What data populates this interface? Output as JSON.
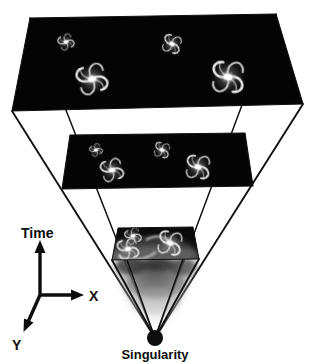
{
  "figure": {
    "type": "diagram",
    "background_color": "#ffffff",
    "line_color": "#111111",
    "slice_color": "#050505",
    "labels": {
      "time_axis": "Time",
      "x_axis": "X",
      "y_axis": "Y",
      "singularity": "Singularity"
    },
    "axes_legend": {
      "origin": [
        40,
        295
      ],
      "time_arrow_end": [
        40,
        243
      ],
      "x_arrow_end": [
        82,
        295
      ],
      "y_arrow_end": [
        25,
        330
      ]
    },
    "singularity_point": {
      "cx": 155,
      "cy": 338,
      "r": 8,
      "color": "#0d0d0d"
    },
    "slices": [
      {
        "name": "top-slice",
        "epoch": "late-time",
        "galaxy_count": 4,
        "corners": {
          "back_left": [
            30,
            18
          ],
          "back_right": [
            276,
            14
          ],
          "front_right": [
            303,
            104
          ],
          "front_left": [
            12,
            111
          ]
        },
        "galaxies": [
          {
            "cx": 66,
            "cy": 42,
            "r": 9,
            "rot": -18,
            "arms": 4,
            "brightness": 0.72
          },
          {
            "cx": 172,
            "cy": 44,
            "r": 11,
            "rot": 25,
            "arms": 5,
            "brightness": 0.8
          },
          {
            "cx": 92,
            "cy": 79,
            "r": 17,
            "rot": -10,
            "arms": 5,
            "brightness": 1.0
          },
          {
            "cx": 228,
            "cy": 77,
            "r": 19,
            "rot": 12,
            "arms": 6,
            "brightness": 0.95
          }
        ]
      },
      {
        "name": "middle-slice",
        "epoch": "mid-time",
        "galaxy_count": 4,
        "corners": {
          "back_left": [
            70,
            135
          ],
          "back_right": [
            245,
            133
          ],
          "front_right": [
            253,
            186
          ],
          "front_left": [
            62,
            189
          ]
        },
        "galaxies": [
          {
            "cx": 96,
            "cy": 150,
            "r": 7,
            "rot": -20,
            "arms": 4,
            "brightness": 0.7
          },
          {
            "cx": 162,
            "cy": 150,
            "r": 9,
            "rot": 22,
            "arms": 5,
            "brightness": 0.82
          },
          {
            "cx": 112,
            "cy": 170,
            "r": 13,
            "rot": -8,
            "arms": 5,
            "brightness": 1.0
          },
          {
            "cx": 198,
            "cy": 167,
            "r": 14,
            "rot": 15,
            "arms": 6,
            "brightness": 0.95
          }
        ]
      },
      {
        "name": "bottom-slice",
        "epoch": "early-time-merger",
        "galaxy_count": 3,
        "corners": {
          "back_left": [
            118,
            228
          ],
          "back_right": [
            193,
            227
          ],
          "front_right": [
            199,
            259
          ],
          "front_left": [
            112,
            260
          ]
        },
        "galaxies": [
          {
            "cx": 133,
            "cy": 236,
            "r": 9,
            "rot": -15,
            "arms": 4,
            "brightness": 0.9
          },
          {
            "cx": 128,
            "cy": 249,
            "r": 12,
            "rot": -5,
            "arms": 5,
            "brightness": 1.0
          },
          {
            "cx": 170,
            "cy": 243,
            "r": 14,
            "rot": 20,
            "arms": 5,
            "brightness": 1.0
          }
        ]
      }
    ],
    "glow": {
      "name": "primordial-glow",
      "top_y": 260,
      "bottom_y": 336,
      "top_color": "#3a3a3a",
      "bottom_color": "#ffffff"
    },
    "cone_edges": [
      {
        "from": [
          12,
          111
        ],
        "to": [
          155,
          338
        ]
      },
      {
        "from": [
          303,
          104
        ],
        "to": [
          155,
          338
        ]
      },
      {
        "from": [
          30,
          18
        ],
        "to": [
          155,
          338
        ]
      },
      {
        "from": [
          276,
          14
        ],
        "to": [
          155,
          338
        ]
      }
    ]
  }
}
